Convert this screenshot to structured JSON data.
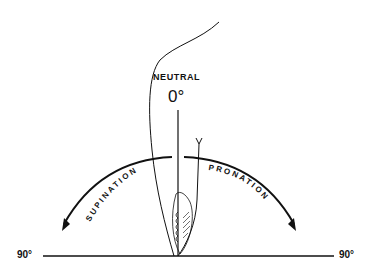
{
  "diagram": {
    "labels": {
      "neutral": "NEUTRAL",
      "zero": "0°",
      "supination": "SUPINATION",
      "pronation": "PRONATION",
      "left_degree": "90°",
      "right_degree": "90°"
    },
    "colors": {
      "ink": "#111111",
      "background": "#ffffff"
    }
  }
}
